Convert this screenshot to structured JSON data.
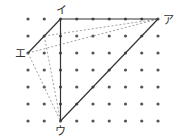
{
  "diagram": {
    "type": "dot-grid-geometry",
    "grid": {
      "columns": 9,
      "rows": 7,
      "origin_x": 28,
      "origin_y": 19,
      "spacing_x": 16.25,
      "spacing_y": 17,
      "dot_color": "#555555"
    },
    "points": {
      "a": {
        "label": "ア",
        "col": 8,
        "row": 0
      },
      "i": {
        "label": "イ",
        "col": 2,
        "row": 0
      },
      "u": {
        "label": "ウ",
        "col": 2,
        "row": 6
      },
      "e": {
        "label": "エ",
        "col": 0,
        "row": 2
      },
      "p": {
        "label": "",
        "col": 1,
        "row": 1
      }
    },
    "solid_lines": [
      [
        "i",
        "a"
      ],
      [
        "i",
        "u"
      ],
      [
        "u",
        "a"
      ],
      [
        "e",
        "i"
      ]
    ],
    "dashed_lines": [
      [
        "e",
        "a"
      ],
      [
        "p",
        "a"
      ],
      [
        "e",
        "u"
      ],
      [
        "p",
        "u"
      ]
    ],
    "colors": {
      "solid_line": "#333333",
      "dashed_line": "#888888",
      "label": "#333333"
    }
  }
}
